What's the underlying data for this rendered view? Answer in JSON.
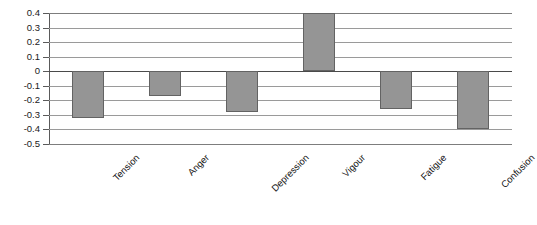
{
  "chart_data": {
    "type": "bar",
    "title": "",
    "subtitle": "",
    "xlabel": "",
    "ylabel": "",
    "categories": [
      "Tension",
      "Anger",
      "Depression",
      "Vigour",
      "Fatigue",
      "Confusion"
    ],
    "values": [
      -0.32,
      -0.17,
      -0.28,
      0.4,
      -0.26,
      -0.4
    ],
    "series": [
      {
        "name": "Mood change",
        "values": [
          -0.32,
          -0.17,
          -0.28,
          0.4,
          -0.26,
          -0.4
        ]
      }
    ],
    "ylim": [
      -0.5,
      0.4
    ],
    "ytick_labels": [
      "0.4",
      "0.3",
      "0.2",
      "0.1",
      "0",
      "-0.1",
      "-0.2",
      "-0.3",
      "-0.4",
      "-0.5"
    ],
    "ytick_values": [
      0.4,
      0.3,
      0.2,
      0.1,
      0,
      -0.1,
      -0.2,
      -0.3,
      -0.4,
      -0.5
    ],
    "grid": true,
    "legend": false,
    "legend_position": "none",
    "bar_color": "#959595",
    "bar_border_color": "#636363",
    "gridline_color": "#9a9a9a",
    "zero_line_color": "#4a4a4a",
    "axis_color": "#5a5a5a",
    "background_color": "#ffffff",
    "xtick_label_rotation": -45
  }
}
